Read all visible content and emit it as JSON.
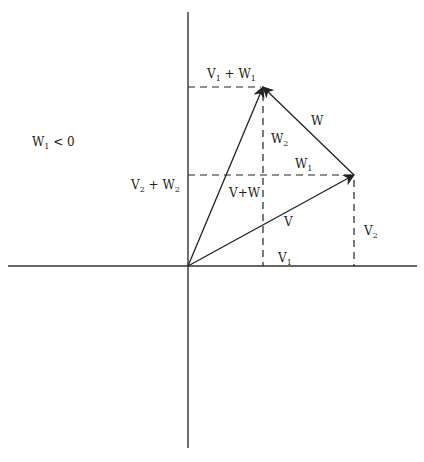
{
  "diagram": {
    "colors": {
      "line": "#222222",
      "axis": "#333333",
      "background": "#ffffff"
    },
    "axes": {
      "origin": [
        188,
        266
      ],
      "x_axis": {
        "from": [
          8,
          266
        ],
        "to": [
          417,
          266
        ]
      },
      "y_axis": {
        "from": [
          188,
          12
        ],
        "to": [
          188,
          448
        ]
      }
    },
    "vectors": [
      {
        "name": "V",
        "from": [
          188,
          266
        ],
        "to": [
          354,
          175
        ]
      },
      {
        "name": "V+W",
        "from": [
          188,
          266
        ],
        "to": [
          263,
          87
        ]
      },
      {
        "name": "W",
        "from": [
          354,
          175
        ],
        "to": [
          263,
          87
        ]
      }
    ],
    "dashed_lines": [
      {
        "name": "V1+W1-horizontal",
        "from": [
          188,
          87
        ],
        "to": [
          263,
          87
        ]
      },
      {
        "name": "V2+W2-horizontal",
        "from": [
          188,
          175
        ],
        "to": [
          354,
          175
        ]
      },
      {
        "name": "V1+W1-vertical",
        "from": [
          263,
          87
        ],
        "to": [
          263,
          266
        ]
      },
      {
        "name": "V1-V2-vertical",
        "from": [
          354,
          175
        ],
        "to": [
          354,
          266
        ]
      }
    ],
    "labels": {
      "condition": {
        "main": "W",
        "sub": "1",
        "rest": " < 0"
      },
      "v1_plus_w1": {
        "a": "V",
        "a_sub": "1",
        "mid": " + W",
        "b_sub": "1"
      },
      "v2_plus_w2": {
        "a": "V",
        "a_sub": "2",
        "mid": " + W",
        "b_sub": "2"
      },
      "w": "W",
      "w2": {
        "main": "W",
        "sub": "2"
      },
      "w1": {
        "main": "W",
        "sub": "1"
      },
      "v_plus_w": "V+W",
      "v": "V",
      "v1": {
        "main": "V",
        "sub": "1"
      },
      "v2": {
        "main": "V",
        "sub": "2"
      }
    }
  }
}
